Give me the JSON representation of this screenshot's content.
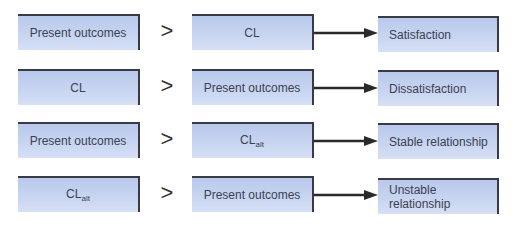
{
  "diagram": {
    "operator": ">",
    "rows": [
      {
        "left": "Present outcomes",
        "middle": "CL",
        "middle_sub": "",
        "left_sub": "",
        "result": "Satisfaction"
      },
      {
        "left": "CL",
        "left_sub": "",
        "middle": "Present outcomes",
        "middle_sub": "",
        "result": "Dissatisfaction"
      },
      {
        "left": "Present outcomes",
        "left_sub": "",
        "middle": "CL",
        "middle_sub": "alt",
        "result": "Stable relationship"
      },
      {
        "left": "CL",
        "left_sub": "alt",
        "middle": "Present outcomes",
        "middle_sub": "",
        "result": "Unstable relationship"
      }
    ],
    "colors": {
      "box_fill": "#c9d6f1",
      "box_border": "#3a3a44",
      "arrow": "#2a2a2a",
      "text": "#3d4150"
    }
  }
}
